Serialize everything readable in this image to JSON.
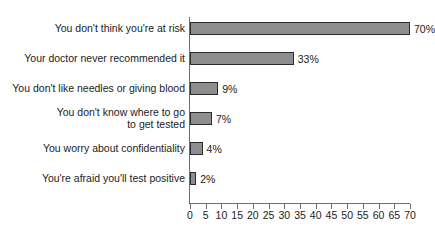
{
  "chart_data": {
    "type": "bar",
    "orientation": "horizontal",
    "title": "",
    "subtitle": "",
    "xlabel": "",
    "ylabel": "",
    "xlim": [
      0,
      70
    ],
    "grid": false,
    "legend": null,
    "units": "%",
    "categories": [
      "You don't think you're at risk",
      "Your doctor never recommended it",
      "You don't like needles or giving blood",
      "You don't know where to go\nto get tested",
      "You worry about confidentiality",
      "You're afraid you'll test positive"
    ],
    "values": [
      70,
      33,
      9,
      7,
      4,
      2
    ],
    "value_labels": [
      "70%",
      "33%",
      "9%",
      "7%",
      "4%",
      "2%"
    ],
    "tick_labels": [
      "0",
      "5",
      "10",
      "15",
      "20",
      "25",
      "30",
      "35",
      "40",
      "45",
      "50",
      "55",
      "60",
      "65",
      "70"
    ],
    "tick_values": [
      0,
      5,
      10,
      15,
      20,
      25,
      30,
      35,
      40,
      45,
      50,
      55,
      60,
      65,
      70
    ],
    "colors": {
      "bar_fill": "#8e8e8e",
      "bar_border": "#2b2b2b",
      "axis": "#6e6e6e",
      "text": "#1c1c1c",
      "background": "#ffffff"
    }
  }
}
